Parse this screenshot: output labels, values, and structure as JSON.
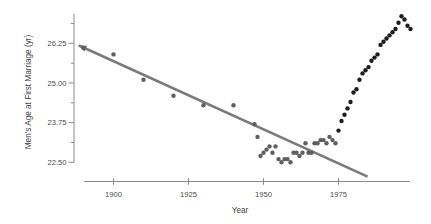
{
  "figure": {
    "background": "#ffffff",
    "axis_color": "#8c8c8c",
    "tick_text_color": "#4a4a4a",
    "trend_line_color": "#7a7a7a",
    "early_point_color": "#5f5f5f",
    "recent_point_color": "#1d1d1d"
  },
  "chart_data": {
    "type": "scatter",
    "title": "",
    "xlabel": "Year",
    "ylabel": "Men's Age at First Marriage (yr)",
    "x_ticks": [
      1900,
      1925,
      1950,
      1975
    ],
    "x_tick_labels": [
      "1900",
      "1925",
      "1950",
      "1975"
    ],
    "y_ticks": [
      26.25,
      25.0,
      23.75,
      22.5
    ],
    "y_tick_labels": [
      "26.25",
      "25.00",
      "23.75",
      "22.50"
    ],
    "y_minor_ticks": [
      26.875,
      25.625,
      24.375,
      23.125
    ],
    "xlim": [
      1890,
      2000
    ],
    "ylim": [
      22.5,
      27.2
    ],
    "grid": false,
    "legend": null,
    "series": [
      {
        "name": "age-at-first-marriage-1890-1974",
        "style": "early",
        "points": [
          [
            1890,
            26.1
          ],
          [
            1900,
            25.9
          ],
          [
            1910,
            25.1
          ],
          [
            1920,
            24.6
          ],
          [
            1930,
            24.3
          ],
          [
            1940,
            24.3
          ],
          [
            1947,
            23.7
          ],
          [
            1948,
            23.3
          ],
          [
            1949,
            22.7
          ],
          [
            1950,
            22.8
          ],
          [
            1951,
            22.9
          ],
          [
            1952,
            23.0
          ],
          [
            1953,
            22.8
          ],
          [
            1954,
            23.0
          ],
          [
            1955,
            22.6
          ],
          [
            1956,
            22.5
          ],
          [
            1957,
            22.6
          ],
          [
            1958,
            22.6
          ],
          [
            1959,
            22.5
          ],
          [
            1960,
            22.8
          ],
          [
            1961,
            22.8
          ],
          [
            1962,
            22.7
          ],
          [
            1963,
            22.8
          ],
          [
            1964,
            23.1
          ],
          [
            1965,
            22.8
          ],
          [
            1966,
            22.8
          ],
          [
            1967,
            23.1
          ],
          [
            1968,
            23.1
          ],
          [
            1969,
            23.2
          ],
          [
            1970,
            23.2
          ],
          [
            1971,
            23.1
          ],
          [
            1972,
            23.3
          ],
          [
            1973,
            23.2
          ],
          [
            1974,
            23.1
          ]
        ]
      },
      {
        "name": "age-at-first-marriage-1975-1999",
        "style": "recent",
        "points": [
          [
            1975,
            23.5
          ],
          [
            1976,
            23.8
          ],
          [
            1977,
            24.0
          ],
          [
            1978,
            24.2
          ],
          [
            1979,
            24.4
          ],
          [
            1980,
            24.7
          ],
          [
            1981,
            24.8
          ],
          [
            1982,
            25.1
          ],
          [
            1983,
            25.3
          ],
          [
            1984,
            25.4
          ],
          [
            1985,
            25.5
          ],
          [
            1986,
            25.7
          ],
          [
            1987,
            25.8
          ],
          [
            1988,
            25.9
          ],
          [
            1989,
            26.2
          ],
          [
            1990,
            26.3
          ],
          [
            1991,
            26.4
          ],
          [
            1992,
            26.5
          ],
          [
            1993,
            26.6
          ],
          [
            1994,
            26.7
          ],
          [
            1995,
            26.9
          ],
          [
            1996,
            27.1
          ],
          [
            1997,
            27.0
          ],
          [
            1998,
            26.8
          ],
          [
            1999,
            26.7
          ]
        ]
      }
    ],
    "trend_line": {
      "description": "linear fit to pre-1950 data, extrapolated; arrowhead at upper-left end",
      "x1": 1888.5,
      "y1": 26.18,
      "x2": 1984.7,
      "y2": 22.05,
      "arrow_at_start": true
    }
  }
}
